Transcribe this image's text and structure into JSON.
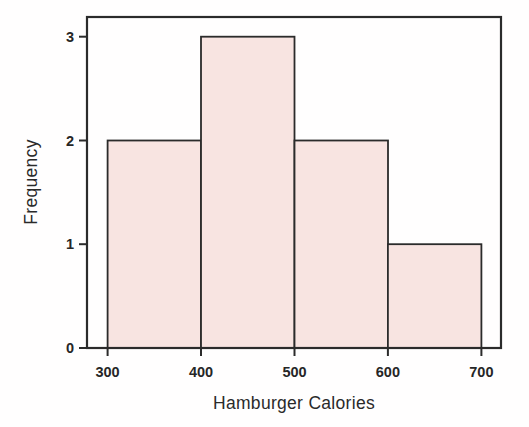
{
  "chart_data": {
    "type": "bar",
    "subtype": "histogram",
    "title": "",
    "xlabel": "Hamburger Calories",
    "ylabel": "Frequency",
    "bin_edges": [
      300,
      400,
      500,
      600,
      700
    ],
    "frequencies": [
      2,
      3,
      2,
      1
    ],
    "bins": [
      {
        "range": "300-400",
        "frequency": 2
      },
      {
        "range": "400-500",
        "frequency": 3
      },
      {
        "range": "500-600",
        "frequency": 2
      },
      {
        "range": "600-700",
        "frequency": 1
      }
    ],
    "x_ticks": [
      300,
      400,
      500,
      600,
      700
    ],
    "y_ticks": [
      0,
      1,
      2,
      3
    ],
    "xlim": [
      278,
      721
    ],
    "ylim": [
      0,
      3.19
    ],
    "grid": false,
    "legend": "none",
    "frame": "full-box",
    "bar_fill": "#f8e4e1",
    "bar_stroke": "#2b2b2b",
    "axis_color": "#2b2b2b",
    "background": "#fffefe"
  }
}
